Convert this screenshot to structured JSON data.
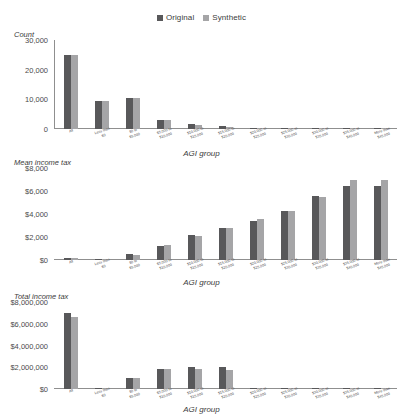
{
  "legend": {
    "items": [
      {
        "label": "Original",
        "color": "#58585a",
        "icon": "square-swatch-icon"
      },
      {
        "label": "Synthetic",
        "color": "#a5a5a7",
        "icon": "square-swatch-icon"
      }
    ]
  },
  "categories": [
    "All",
    "Less than\n$0",
    "$0 to\n$5,000",
    "$5,000 to\n$10,000",
    "$10,000 to\n$15,000",
    "$15,000 to\n$20,000",
    "$20,000 to\n$25,000",
    "$25,000 to\n$30,000",
    "$30,000 to\n$35,000",
    "$35,000 to\n$40,000",
    "More than\n$45,000"
  ],
  "charts": [
    {
      "id": "count-chart",
      "ylabel": "Count",
      "xlabel": "AGI group",
      "yticks": [
        "30,000",
        "20,000",
        "10,000",
        "0"
      ],
      "ytick_values": [
        30000,
        20000,
        10000,
        0
      ]
    },
    {
      "id": "mean-income-tax-chart",
      "ylabel": "Mean income tax",
      "xlabel": "AGI group",
      "yticks": [
        "$8,000",
        "$6,000",
        "$4,000",
        "$2,000",
        "$0"
      ],
      "ytick_values": [
        8000,
        6000,
        4000,
        2000,
        0
      ]
    },
    {
      "id": "total-income-tax-chart",
      "ylabel": "Total income tax",
      "xlabel": "AGI group",
      "yticks": [
        "$8,000,000",
        "$6,000,000",
        "$4,000,000",
        "$2,000,000",
        "$0"
      ],
      "ytick_values": [
        8000000,
        6000000,
        4000000,
        2000000,
        0
      ]
    }
  ],
  "chart_data": [
    {
      "type": "bar",
      "title": "",
      "xlabel": "AGI group",
      "ylabel": "Count",
      "ylim": [
        0,
        30000
      ],
      "yticks": [
        0,
        10000,
        20000,
        30000
      ],
      "grid": false,
      "legend": "top-center",
      "categories": [
        "All",
        "Less than $0",
        "$0 to $5,000",
        "$5,000 to $10,000",
        "$10,000 to $15,000",
        "$15,000 to $20,000",
        "$20,000 to $25,000",
        "$25,000 to $30,000",
        "$30,000 to $35,000",
        "$35,000 to $40,000",
        "More than $45,000"
      ],
      "series": [
        {
          "name": "Original",
          "values": [
            24800,
            9500,
            10500,
            2900,
            1700,
            900,
            260,
            140,
            90,
            60,
            40
          ]
        },
        {
          "name": "Synthetic",
          "values": [
            24800,
            9400,
            10600,
            2950,
            1500,
            700,
            220,
            120,
            80,
            50,
            40
          ]
        }
      ]
    },
    {
      "type": "bar",
      "title": "",
      "xlabel": "AGI group",
      "ylabel": "Mean income tax",
      "ylim": [
        0,
        8000
      ],
      "yticks": [
        0,
        2000,
        4000,
        6000,
        8000
      ],
      "grid": false,
      "legend": "top-center",
      "categories": [
        "All",
        "Less than $0",
        "$0 to $5,000",
        "$5,000 to $10,000",
        "$10,000 to $15,000",
        "$15,000 to $20,000",
        "$20,000 to $25,000",
        "$25,000 to $30,000",
        "$30,000 to $35,000",
        "$35,000 to $40,000",
        "More than $45,000"
      ],
      "series": [
        {
          "name": "Original",
          "values": [
            180,
            30,
            480,
            1250,
            2150,
            2750,
            3400,
            4300,
            5550,
            6450,
            6450
          ]
        },
        {
          "name": "Synthetic",
          "values": [
            190,
            20,
            470,
            1280,
            2080,
            2800,
            3550,
            4250,
            5500,
            7000,
            7000
          ]
        }
      ]
    },
    {
      "type": "bar",
      "title": "",
      "xlabel": "AGI group",
      "ylabel": "Total income tax",
      "ylim": [
        0,
        8000000
      ],
      "yticks": [
        0,
        2000000,
        4000000,
        6000000,
        8000000
      ],
      "grid": false,
      "legend": "top-center",
      "categories": [
        "All",
        "Less than $0",
        "$0 to $5,000",
        "$5,000 to $10,000",
        "$10,000 to $15,000",
        "$15,000 to $20,000",
        "$20,000 to $25,000",
        "$25,000 to $30,000",
        "$30,000 to $35,000",
        "$35,000 to $40,000",
        "More than $45,000"
      ],
      "series": [
        {
          "name": "Original",
          "values": [
            6950000,
            20000,
            1000000,
            1850000,
            2030000,
            2020000,
            120000,
            60000,
            40000,
            30000,
            20000
          ]
        },
        {
          "name": "Synthetic",
          "values": [
            6650000,
            10000,
            1000000,
            1820000,
            1860000,
            1760000,
            100000,
            50000,
            30000,
            25000,
            20000
          ]
        }
      ]
    }
  ]
}
